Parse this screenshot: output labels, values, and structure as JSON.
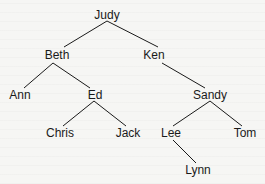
{
  "diagram": {
    "type": "tree",
    "colors": {
      "line": "#1a1a1a",
      "text": "#1a1a1a",
      "background": "#f6f6f4"
    },
    "nodes": [
      {
        "id": "judy",
        "label": "Judy",
        "x": 107,
        "y": 15
      },
      {
        "id": "beth",
        "label": "Beth",
        "x": 57,
        "y": 55
      },
      {
        "id": "ken",
        "label": "Ken",
        "x": 154,
        "y": 55
      },
      {
        "id": "ann",
        "label": "Ann",
        "x": 20,
        "y": 95
      },
      {
        "id": "ed",
        "label": "Ed",
        "x": 95,
        "y": 95
      },
      {
        "id": "sandy",
        "label": "Sandy",
        "x": 210,
        "y": 95
      },
      {
        "id": "chris",
        "label": "Chris",
        "x": 60,
        "y": 133
      },
      {
        "id": "jack",
        "label": "Jack",
        "x": 128,
        "y": 133
      },
      {
        "id": "lee",
        "label": "Lee",
        "x": 171,
        "y": 133
      },
      {
        "id": "tom",
        "label": "Tom",
        "x": 245,
        "y": 133
      },
      {
        "id": "lynn",
        "label": "Lynn",
        "x": 198,
        "y": 170
      }
    ],
    "edges": [
      {
        "from": "judy",
        "to": "beth",
        "x1": 107,
        "y1": 21,
        "x2": 64,
        "y2": 47
      },
      {
        "from": "judy",
        "to": "ken",
        "x1": 107,
        "y1": 21,
        "x2": 158,
        "y2": 47
      },
      {
        "from": "beth",
        "to": "ann",
        "x1": 53,
        "y1": 63,
        "x2": 24,
        "y2": 88
      },
      {
        "from": "beth",
        "to": "ed",
        "x1": 53,
        "y1": 63,
        "x2": 90,
        "y2": 88
      },
      {
        "from": "ken",
        "to": "sandy",
        "x1": 162,
        "y1": 63,
        "x2": 205,
        "y2": 88
      },
      {
        "from": "ed",
        "to": "chris",
        "x1": 94,
        "y1": 101,
        "x2": 63,
        "y2": 126
      },
      {
        "from": "ed",
        "to": "jack",
        "x1": 94,
        "y1": 101,
        "x2": 126,
        "y2": 126
      },
      {
        "from": "sandy",
        "to": "lee",
        "x1": 210,
        "y1": 101,
        "x2": 173,
        "y2": 126
      },
      {
        "from": "sandy",
        "to": "tom",
        "x1": 210,
        "y1": 101,
        "x2": 242,
        "y2": 126
      },
      {
        "from": "lee",
        "to": "lynn",
        "x1": 173,
        "y1": 140,
        "x2": 196,
        "y2": 163
      }
    ]
  }
}
